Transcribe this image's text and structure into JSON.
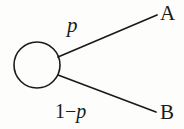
{
  "figure": {
    "type": "probability-branch-diagram",
    "background_color": "#fdfdfc",
    "stroke_color": "#1a1a1a",
    "text_color": "#1a1a1a"
  },
  "node": {
    "shape": "circle",
    "center_x": 37,
    "center_y": 65,
    "radius": 23,
    "fill": "none",
    "stroke_width": 1.6
  },
  "branches": [
    {
      "id": "branch-upper",
      "probability_label": "p",
      "outcome_label": "A",
      "from_x": 58,
      "from_y": 57,
      "to_x": 157,
      "to_y": 15
    },
    {
      "id": "branch-lower",
      "probability_label_prefix": "1",
      "probability_label_operator": "−",
      "probability_label_variable": "p",
      "probability_label_full": "1−p",
      "outcome_label": "B",
      "from_x": 58,
      "from_y": 75,
      "to_x": 156,
      "to_y": 112
    }
  ],
  "labels": {
    "upper_probability": "p",
    "lower_probability_prefix": "1",
    "lower_probability_operator": "−",
    "lower_probability_variable": "p",
    "outcome_a": "A",
    "outcome_b": "B"
  }
}
